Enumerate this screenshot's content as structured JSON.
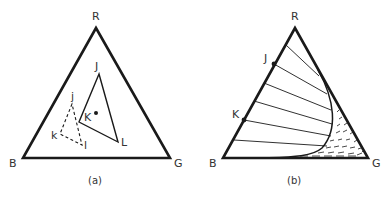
{
  "figure": {
    "colors": {
      "ink": "#1a1a1a",
      "label": "#333333",
      "background": "#ffffff"
    },
    "panel_a": {
      "caption": "(a)",
      "vertices": {
        "top": "R",
        "left": "B",
        "right": "G"
      },
      "solid_triangle": {
        "labels": [
          "J",
          "K",
          "L"
        ]
      },
      "dashed_triangle": {
        "labels": [
          "j",
          "k",
          "l"
        ]
      },
      "point_label": "K"
    },
    "panel_b": {
      "caption": "(b)",
      "vertices": {
        "top": "R",
        "left": "B",
        "right": "G"
      },
      "edge_points": [
        "J",
        "K"
      ]
    }
  }
}
